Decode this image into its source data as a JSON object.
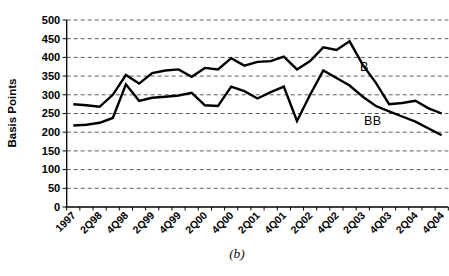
{
  "figure": {
    "caption": "(b)",
    "background": "#ffffff"
  },
  "chart_data": {
    "type": "line",
    "title": "",
    "xlabel": "",
    "ylabel": "Basis Points",
    "ylim": [
      0,
      500
    ],
    "ytick_step": 50,
    "ytick_labels": [
      "0",
      "50",
      "100",
      "150",
      "200",
      "250",
      "300",
      "350",
      "400",
      "450",
      "500"
    ],
    "x_tick_labels_shown": [
      "1997",
      "2Q98",
      "4Q98",
      "2Q99",
      "4Q99",
      "2Q00",
      "4Q00",
      "2Q01",
      "4Q01",
      "2Q02",
      "4Q02",
      "2Q03",
      "4Q03",
      "2Q04",
      "4Q04"
    ],
    "label_every": 2,
    "categories": [
      "1997",
      "1Q98",
      "2Q98",
      "3Q98",
      "4Q98",
      "1Q99",
      "2Q99",
      "3Q99",
      "4Q99",
      "1Q00",
      "2Q00",
      "3Q00",
      "4Q00",
      "1Q01",
      "2Q01",
      "3Q01",
      "4Q01",
      "1Q02",
      "2Q02",
      "3Q02",
      "4Q02",
      "1Q03",
      "2Q03",
      "3Q03",
      "4Q03",
      "1Q04",
      "2Q04",
      "3Q04",
      "4Q04"
    ],
    "grid": {
      "horizontal": true,
      "style": "dashed",
      "color": "#4a4a4a"
    },
    "axis_color": "#000000",
    "line_color": "#000000",
    "legend_position": "inline-labels-on-plot",
    "series": [
      {
        "name": "B",
        "values": [
          275,
          272,
          268,
          300,
          353,
          330,
          358,
          365,
          368,
          348,
          372,
          368,
          398,
          378,
          388,
          390,
          402,
          368,
          390,
          427,
          420,
          443,
          380,
          332,
          275,
          278,
          284,
          264,
          250
        ],
        "label_pos_px": {
          "x": 360,
          "y": 60
        }
      },
      {
        "name": "BB",
        "values": [
          218,
          220,
          225,
          238,
          328,
          284,
          292,
          295,
          298,
          305,
          272,
          270,
          322,
          310,
          290,
          307,
          322,
          230,
          300,
          365,
          345,
          325,
          295,
          270,
          256,
          242,
          228,
          210,
          192
        ],
        "label_pos_px": {
          "x": 364,
          "y": 114
        }
      }
    ]
  }
}
